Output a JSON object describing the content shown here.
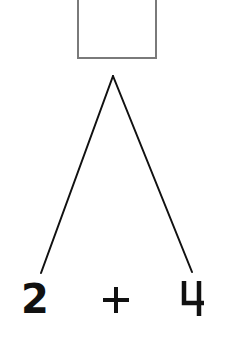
{
  "diagram": {
    "type": "number-bond",
    "answer_box": {
      "value": ""
    },
    "left_term": "2",
    "operator": "+",
    "right_term": "4",
    "colors": {
      "box_border": "#7a7a7a",
      "line": "#111111",
      "text": "#111111",
      "background": "#ffffff"
    }
  }
}
